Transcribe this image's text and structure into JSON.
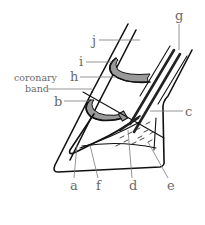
{
  "diagram": {
    "labels": {
      "a": "a",
      "b": "b",
      "c": "c",
      "d": "d",
      "e": "e",
      "f": "f",
      "g": "g",
      "h": "h",
      "i": "i",
      "j": "j",
      "coronary_line1": "coronary",
      "coronary_line2": "band"
    },
    "colors": {
      "outline": "#111111",
      "joint_fill": "#9a9a9a",
      "label_text": "#6a6a6a",
      "leader_line": "#7a7a7a",
      "background": "#ffffff"
    }
  }
}
